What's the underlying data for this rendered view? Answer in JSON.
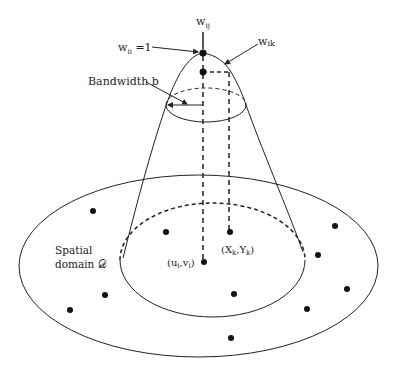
{
  "diagram": {
    "labels": {
      "w_ij": "w",
      "w_ij_sub": "ij",
      "w_ii": "w",
      "w_ii_sub": "ii",
      "w_ii_eq": " =1",
      "w_ik": "w",
      "w_ik_sub": "ik",
      "bandwidth": "Bandwidth b",
      "spatial_line1": "Spatial",
      "spatial_line2": "domain 𝒟",
      "regression_point": "(u",
      "regression_point_sub1": "i",
      "regression_point_mid": ",v",
      "regression_point_sub2": "i",
      "regression_point_end": ")",
      "data_point": "(X",
      "data_point_sub1": "k",
      "data_point_mid": ",Y",
      "data_point_sub2": "k",
      "data_point_end": ")"
    },
    "colors": {
      "stroke": "#222222",
      "background": "#ffffff"
    },
    "data_point_count": 12
  }
}
